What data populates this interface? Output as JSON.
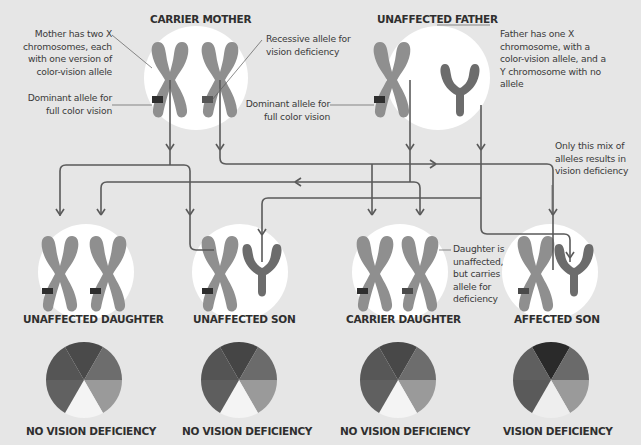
{
  "parents": {
    "mother": {
      "title": "CARRIER MOTHER",
      "note_two_x": "Mother has two X chromosomes, each with one version of color-vision allele",
      "note_dominant": "Dominant allele for full color vision",
      "note_recessive": "Recessive allele for vision deficiency"
    },
    "father": {
      "title": "UNAFFECTED FATHER",
      "note_xy": "Father has one X chromosome, with a color-vision allele, and a Y chromosome with no allele",
      "note_dominant": "Dominant allele for full color vision"
    }
  },
  "annotations": {
    "mix_note": "Only this mix of alleles results in vision deficiency",
    "carrier_note": "Daughter is unaffected, but carries allele for deficiency"
  },
  "offspring": [
    {
      "title": "UNAFFECTED DAUGHTER",
      "outcome": "NO VISION DEFICIENCY",
      "chromosomes": [
        "X-dominant",
        "X-dominant"
      ]
    },
    {
      "title": "UNAFFECTED SON",
      "outcome": "NO VISION DEFICIENCY",
      "chromosomes": [
        "X-dominant",
        "Y"
      ]
    },
    {
      "title": "CARRIER DAUGHTER",
      "outcome": "NO VISION DEFICIENCY",
      "chromosomes": [
        "X-dominant",
        "X-recessive"
      ]
    },
    {
      "title": "AFFECTED SON",
      "outcome": "VISION DEFICIENCY",
      "chromosomes": [
        "X-recessive",
        "Y"
      ]
    }
  ],
  "colors": {
    "background": "#e6e6e6",
    "circle": "#ffffff",
    "x_chromosome": "#8f8f8f",
    "y_chromosome": "#6c6c6c",
    "dominant_band": "#2e2e2e",
    "recessive_band": "#555555",
    "line": "#5a5a5a"
  }
}
